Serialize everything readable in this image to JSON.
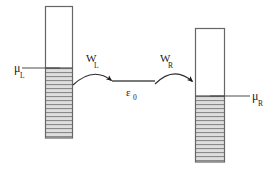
{
  "figure": {
    "type": "energy-level-diagram",
    "background_color": "#ffffff",
    "outline_color": "#555555",
    "fill_hatch_color": "#8c8c8c",
    "fill_band_color": "#d9d9d9",
    "line_color": "#4d4d4d",
    "text_color": "#1a1a1a",
    "width": 276,
    "height": 172
  },
  "left_electrode": {
    "name": "left lead",
    "box": {
      "x": 45,
      "y": 6,
      "width": 28,
      "height": 132
    },
    "fermi_level_y": 68,
    "filled_from_y": 68,
    "filled_to_y": 138,
    "hatch_line_count": 18,
    "chemical_potential": {
      "symbol": "μ",
      "subscript": "L",
      "label_x": 15,
      "label_y": 72,
      "line_from_x": 22,
      "line_to_x": 60,
      "line_y": 68
    }
  },
  "right_electrode": {
    "name": "right lead",
    "box": {
      "x": 195,
      "y": 28,
      "width": 30,
      "height": 134
    },
    "fermi_level_y": 96,
    "filled_from_y": 96,
    "filled_to_y": 162,
    "hatch_line_count": 17,
    "chemical_potential": {
      "symbol": "μ",
      "subscript": "R",
      "label_x": 254,
      "label_y": 100,
      "line_from_x": 210,
      "line_to_x": 250,
      "line_y": 96
    }
  },
  "central_level": {
    "name": "resonant level",
    "symbol": "ε",
    "subscript": "0",
    "line_from_x": 112,
    "line_to_x": 155,
    "line_y": 81,
    "label_x": 128,
    "label_y": 96
  },
  "couplings": [
    {
      "id": "left-coupling",
      "symbol": "W",
      "subscript": "L",
      "label_x": 92,
      "label_y": 66,
      "arrow_start_x": 73,
      "arrow_start_y": 84,
      "arrow_end_x": 113,
      "arrow_end_y": 81,
      "arrow_control_x": 93,
      "arrow_control_y": 67,
      "direction": "left-lead-to-level"
    },
    {
      "id": "right-coupling",
      "symbol": "W",
      "subscript": "R",
      "label_x": 166,
      "label_y": 66,
      "arrow_start_x": 155,
      "arrow_start_y": 84,
      "arrow_end_x": 194,
      "arrow_end_y": 82,
      "arrow_control_x": 174,
      "arrow_control_y": 66,
      "direction": "level-to-right-lead"
    }
  ]
}
